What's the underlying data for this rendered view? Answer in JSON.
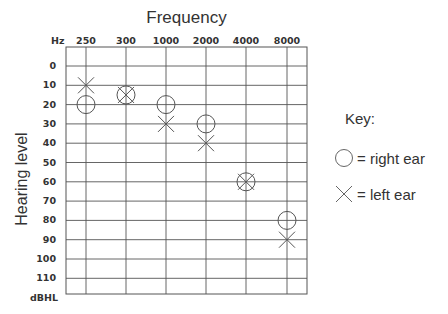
{
  "chart_data": {
    "type": "scatter",
    "title": "Frequency",
    "xlabel": "Hz",
    "ylabel": "Hearing level",
    "y_unit": "dBHL",
    "categories": [
      "250",
      "300",
      "1000",
      "2000",
      "4000",
      "8000"
    ],
    "y_ticks": [
      0,
      10,
      20,
      30,
      40,
      50,
      60,
      70,
      80,
      90,
      100,
      110
    ],
    "ylim": [
      -10,
      120
    ],
    "y_inverted": true,
    "grid": true,
    "series": [
      {
        "name": "right ear",
        "marker": "circle",
        "values": [
          20,
          15,
          20,
          30,
          60,
          80
        ]
      },
      {
        "name": "left ear",
        "marker": "x",
        "values": [
          10,
          15,
          30,
          40,
          60,
          90
        ]
      }
    ],
    "legend": {
      "title": "Key:",
      "position": "right",
      "entries": [
        {
          "marker": "circle",
          "label": "= right ear"
        },
        {
          "marker": "x",
          "label": "= left ear"
        }
      ]
    }
  },
  "colors": {
    "line": "#555555",
    "grid": "#555555",
    "text": "#333333"
  }
}
